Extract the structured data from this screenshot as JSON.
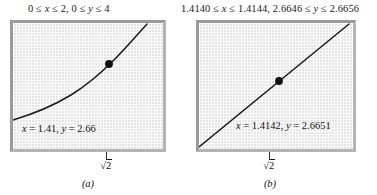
{
  "figure": {
    "background_color": "#ffffff",
    "screen_fill_color": "#e2e2e2",
    "curve_color": "#1a1a1a",
    "frame_shadow_color": "#9a9a9a"
  },
  "panels": [
    {
      "id": "panel-a",
      "range_caption": "0 ≤ x ≤ 2, 0 ≤ y ≤ 4",
      "readout": "x = 1.41, y = 2.66",
      "tick_label_prefix": "√",
      "tick_label_value": "2",
      "subfigure_label": "(a)",
      "point": {
        "x": 1.41,
        "y": 2.66
      },
      "window": {
        "xmin": 0,
        "xmax": 2,
        "ymin": 0,
        "ymax": 4
      }
    },
    {
      "id": "panel-b",
      "range_caption": "1.4140 ≤ x ≤ 1.4144, 2.6646 ≤ y ≤ 2.6656",
      "readout": "x = 1.4142, y = 2.6651",
      "tick_label_prefix": "√",
      "tick_label_value": "2",
      "subfigure_label": "(b)",
      "point": {
        "x": 1.4142,
        "y": 2.6651
      },
      "window": {
        "xmin": 1.414,
        "xmax": 1.4144,
        "ymin": 2.6646,
        "ymax": 2.6656
      }
    }
  ],
  "chart_data": {
    "type": "line",
    "title": "",
    "xlabel": "",
    "ylabel": "",
    "charts": [
      {
        "id": "a",
        "title": "0 ≤ x ≤ 2, 0 ≤ y ≤ 4",
        "xlim": [
          0,
          2
        ],
        "ylim": [
          0,
          4
        ],
        "grid": true,
        "legend": "none",
        "series": [
          {
            "name": "curve",
            "x": [
              0.0,
              0.2,
              0.4,
              0.6,
              0.8,
              1.0,
              1.2,
              1.41,
              1.6,
              1.8,
              2.0
            ],
            "y": [
              0.6,
              0.72,
              0.87,
              1.05,
              1.27,
              1.53,
              1.95,
              2.66,
              3.1,
              3.55,
              4.0
            ]
          }
        ],
        "annotations": [
          {
            "type": "point",
            "x": 1.41,
            "y": 2.66,
            "marker": "filled-circle"
          },
          {
            "type": "text",
            "text": "x = 1.41, y = 2.66",
            "x": 0.08,
            "y": 0.55
          },
          {
            "type": "tick",
            "label": "√2",
            "x": 1.41,
            "axis": "x"
          }
        ]
      },
      {
        "id": "b",
        "title": "1.4140 ≤ x ≤ 1.4144, 2.6646 ≤ y ≤ 2.6656",
        "xlim": [
          1.414,
          1.4144
        ],
        "ylim": [
          2.6646,
          2.6656
        ],
        "grid": true,
        "legend": "none",
        "series": [
          {
            "name": "curve",
            "x": [
              1.414,
              1.4141,
              1.4142,
              1.4143,
              1.4144
            ],
            "y": [
              2.66457,
              2.66483,
              2.6651,
              2.66536,
              2.66562
            ]
          }
        ],
        "annotations": [
          {
            "type": "point",
            "x": 1.4142,
            "y": 2.6651,
            "marker": "filled-circle"
          },
          {
            "type": "text",
            "text": "x = 1.4142, y = 2.6651",
            "x": 1.41411,
            "y": 2.66478
          },
          {
            "type": "tick",
            "label": "√2",
            "x": 1.41421,
            "axis": "x"
          }
        ]
      }
    ]
  }
}
